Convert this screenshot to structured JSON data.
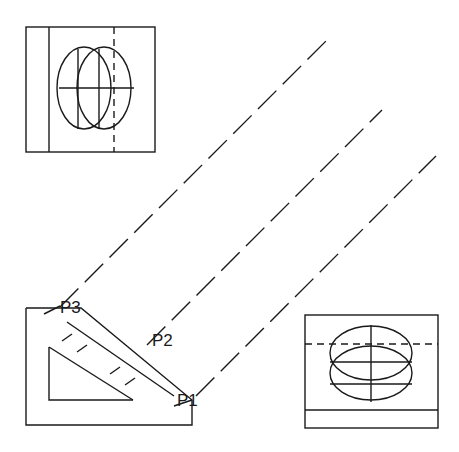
{
  "drawing": {
    "title": "Orthographic projection drawing with 45-degree projection lines",
    "background_color": "#ffffff",
    "line_color": "#1a1a1a",
    "canvas": {
      "width": 459,
      "height": 452
    }
  },
  "labels": {
    "p1": "P1",
    "p2": "P2",
    "p3": "P3"
  },
  "label_positions": {
    "p1": {
      "x": 177,
      "y": 406
    },
    "p2": {
      "x": 152,
      "y": 346
    },
    "p3": {
      "x": 60,
      "y": 313
    }
  },
  "views": {
    "top_left": {
      "name": "top-view",
      "rect": {
        "x": 26,
        "y": 27,
        "width": 129,
        "height": 125
      },
      "vertical_edge_x": 49,
      "ellipses": [
        {
          "cx": 84,
          "cy": 88,
          "rx": 27,
          "ry": 41
        },
        {
          "cx": 104,
          "cy": 88,
          "rx": 27,
          "ry": 41
        }
      ],
      "horizontal_centerline": {
        "y": 88,
        "x1": 59,
        "x2": 134
      },
      "vertical_solid_lines": [
        {
          "x": 78,
          "y1": 49,
          "y2": 129
        },
        {
          "x": 99,
          "y1": 49,
          "y2": 129
        }
      ],
      "vertical_dashed_line": {
        "x": 114,
        "y1": 27,
        "y2": 152
      }
    },
    "bottom_left": {
      "name": "front-view-L-bracket",
      "outline_points": "26,308 26,425 192,425 192,400 81,308",
      "inner_triangle_points": "49,347 49,400 133,400",
      "inner_chamfer": {
        "x1": 49,
        "y1": 347,
        "x2": 133,
        "y2": 400
      },
      "hatch_marks": [
        {
          "x1": 62,
          "y1": 340,
          "x2": 70,
          "y2": 348
        },
        {
          "x1": 73,
          "y1": 329,
          "x2": 82,
          "y2": 338
        },
        {
          "x1": 99,
          "y1": 368,
          "x2": 108,
          "y2": 377
        },
        {
          "x1": 110,
          "y1": 379,
          "x2": 119,
          "y2": 388
        }
      ]
    },
    "bottom_right": {
      "name": "side-view",
      "rect": {
        "x": 305,
        "y": 315,
        "width": 133,
        "height": 113
      },
      "horizontal_edge_y": 410,
      "ellipses": [
        {
          "cx": 371,
          "cy": 353,
          "rx": 41,
          "ry": 27
        },
        {
          "cx": 371,
          "cy": 373,
          "rx": 41,
          "ry": 27
        }
      ],
      "vertical_centerline": {
        "x": 371,
        "x1": 371,
        "y1": 325,
        "y2": 402
      },
      "horizontal_solid_lines": [
        {
          "y": 362,
          "x1": 330,
          "x2": 412
        },
        {
          "y": 384,
          "x1": 330,
          "x2": 412
        }
      ],
      "horizontal_dashed_line": {
        "y": 344,
        "x1": 305,
        "x2": 438
      }
    }
  },
  "projection_lines": [
    {
      "name": "projection-line-p3",
      "x1": 60,
      "y1": 307,
      "x2": 331,
      "y2": 36
    },
    {
      "name": "projection-line-p2",
      "x1": 147,
      "y1": 345,
      "x2": 382,
      "y2": 110
    },
    {
      "name": "projection-line-p1",
      "x1": 196,
      "y1": 396,
      "x2": 436,
      "y2": 156
    }
  ],
  "leader_lines": [
    {
      "name": "leader-p3",
      "x1": 44,
      "y1": 313,
      "x2": 58,
      "y2": 305
    },
    {
      "name": "leader-p1",
      "x1": 192,
      "y1": 400,
      "x2": 174,
      "y2": 404
    }
  ]
}
